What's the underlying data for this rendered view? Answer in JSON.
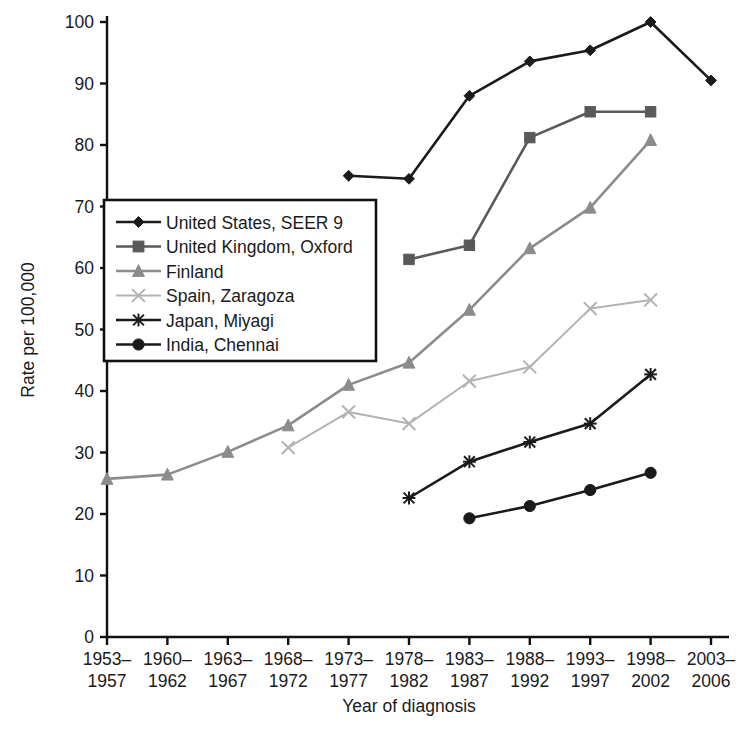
{
  "chart_data": {
    "type": "line",
    "title": "",
    "xlabel": "Year of diagnosis",
    "ylabel": "Rate per 100,000",
    "ylim": [
      0,
      100
    ],
    "ytick_step": 10,
    "yticks": [
      0,
      10,
      20,
      30,
      40,
      50,
      60,
      70,
      80,
      90,
      100
    ],
    "grid": false,
    "legend_position": "inside-left",
    "categories": [
      "1953–\n1957",
      "1960–\n1962",
      "1963–\n1967",
      "1968–\n1972",
      "1973–\n1977",
      "1978–\n1982",
      "1983–\n1987",
      "1988–\n1992",
      "1993–\n1997",
      "1998–\n2002",
      "2003–\n2006"
    ],
    "category_lines": [
      [
        "1953–",
        "1957"
      ],
      [
        "1960–",
        "1962"
      ],
      [
        "1963–",
        "1967"
      ],
      [
        "1968–",
        "1972"
      ],
      [
        "1973–",
        "1977"
      ],
      [
        "1978–",
        "1982"
      ],
      [
        "1983–",
        "1987"
      ],
      [
        "1988–",
        "1992"
      ],
      [
        "1993–",
        "1997"
      ],
      [
        "1998–",
        "2002"
      ],
      [
        "2003–",
        "2006"
      ]
    ],
    "series": [
      {
        "name": "United States, SEER 9",
        "marker": "diamond",
        "color": "#1a1a1a",
        "values": [
          null,
          null,
          null,
          null,
          75.0,
          74.5,
          88.0,
          93.6,
          95.4,
          100.0,
          90.5
        ]
      },
      {
        "name": "United Kingdom, Oxford",
        "marker": "square",
        "color": "#595959",
        "values": [
          null,
          null,
          null,
          null,
          null,
          61.4,
          63.7,
          81.2,
          85.4,
          85.4,
          null
        ]
      },
      {
        "name": "Finland",
        "marker": "triangle",
        "color": "#8c8c8c",
        "values": [
          25.7,
          26.4,
          30.1,
          34.4,
          41.0,
          44.6,
          53.2,
          63.2,
          69.8,
          80.8,
          null
        ]
      },
      {
        "name": "Spain, Zaragoza",
        "marker": "cross",
        "color": "#b3b3b3",
        "values": [
          null,
          null,
          null,
          30.8,
          36.6,
          34.7,
          41.6,
          43.9,
          53.4,
          54.8,
          null
        ]
      },
      {
        "name": "Japan, Miyagi",
        "marker": "star",
        "color": "#1a1a1a",
        "values": [
          null,
          null,
          null,
          null,
          null,
          22.6,
          28.5,
          31.7,
          34.7,
          42.7,
          null
        ]
      },
      {
        "name": "India, Chennai",
        "marker": "circle",
        "color": "#1a1a1a",
        "values": [
          null,
          null,
          null,
          null,
          null,
          null,
          19.3,
          21.3,
          23.9,
          26.7,
          null
        ]
      }
    ]
  },
  "legend": {
    "items": [
      {
        "label": "United States, SEER 9"
      },
      {
        "label": "United Kingdom, Oxford"
      },
      {
        "label": "Finland"
      },
      {
        "label": "Spain, Zaragoza"
      },
      {
        "label": "Japan, Miyagi"
      },
      {
        "label": "India, Chennai"
      }
    ]
  },
  "axes": {
    "y_title": "Rate per 100,000",
    "x_title": "Year of diagnosis"
  }
}
